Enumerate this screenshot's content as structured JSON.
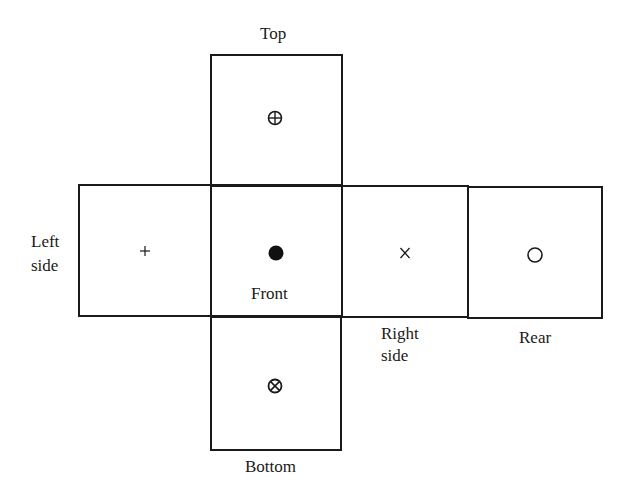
{
  "diagram": {
    "faces": {
      "top": {
        "label": "Top",
        "symbol": "circled-plus",
        "glyph": "⊕"
      },
      "left": {
        "label_line1": "Left",
        "label_line2": "side",
        "symbol": "plus",
        "glyph": "+"
      },
      "front": {
        "label": "Front",
        "symbol": "filled-dot",
        "glyph": "●"
      },
      "right": {
        "label_line1": "Right",
        "label_line2": "side",
        "symbol": "cross",
        "glyph": "x"
      },
      "rear": {
        "label": "Rear",
        "symbol": "open-circle",
        "glyph": "○"
      },
      "bottom": {
        "label": "Bottom",
        "symbol": "circled-times",
        "glyph": "⊗"
      }
    },
    "colors": {
      "line": "#1a1a1a",
      "background": "#ffffff"
    }
  }
}
